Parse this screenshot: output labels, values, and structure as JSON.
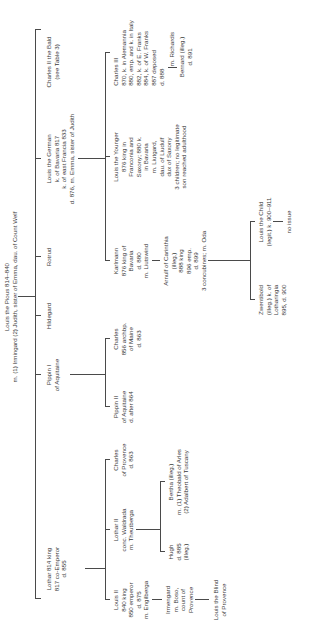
{
  "root": {
    "lines": [
      "Louis the Pious 814–840",
      "m. (1) Irmingard (2) Judith, sister of Emma, dau. of Count Welf"
    ]
  },
  "generation1": [
    {
      "id": "lothar",
      "lines": [
        "Lothar 814 king",
        "817 co-Emperor",
        "d. 855"
      ]
    },
    {
      "id": "pippin1",
      "lines": [
        "Pippin I",
        "of Aquitaine"
      ]
    },
    {
      "id": "hildegard",
      "lines": [
        "Hildegard"
      ]
    },
    {
      "id": "rotrud",
      "lines": [
        "Rotrud"
      ]
    },
    {
      "id": "louis-german",
      "lines": [
        "Louis the German",
        "k. of Bavaria 817",
        "k. of east Francia 833",
        "d. 876, m. Emma, sister of Judith"
      ]
    },
    {
      "id": "charles-bald",
      "lines": [
        "Charles II the Bald",
        "(see Table 3)"
      ]
    }
  ],
  "generation2": [
    {
      "id": "louis2",
      "lines": [
        "Louis II",
        "840 king",
        "850 emperor",
        "d. 875",
        "m. Engilberga"
      ]
    },
    {
      "id": "lothar2",
      "lines": [
        "Lothar II",
        "conc. Waldrada",
        "m. Theutberga"
      ]
    },
    {
      "id": "charles-provence",
      "lines": [
        "Charles",
        "of Provence",
        "d. 863"
      ]
    },
    {
      "id": "pippin2",
      "lines": [
        "Pippin II",
        "of Aquitaine",
        "d. after 864"
      ]
    },
    {
      "id": "charles-maine",
      "lines": [
        "Charles",
        "856 archbp.",
        "of Maine",
        "d. 863"
      ]
    },
    {
      "id": "karlmann",
      "lines": [
        "Karlmann",
        "876 king of",
        "Bavaria",
        "d. 880",
        "m. Liutswind"
      ]
    },
    {
      "id": "louis-younger",
      "lines": [
        "Louis the Younger",
        "876 king in",
        "Franconia and",
        "Saxony; 880 k.",
        "in Bavaria",
        "m. Liutgard,",
        "dau. of Liudulf",
        "dux of Saxony",
        "3 children; no legitimate",
        "son reached adulthood"
      ]
    },
    {
      "id": "charles3",
      "lines": [
        "Charles III",
        "870, k. in Alemannia",
        "880, emp. and k. in Italy",
        "882, k. of E. Franks",
        "884, k. of W. Franks",
        "887 deposed",
        "d. 888"
      ]
    }
  ],
  "generation3": [
    {
      "id": "irmengard",
      "lines": [
        "Irmengard",
        "m. Boso,",
        "count of",
        "Provence"
      ]
    },
    {
      "id": "hugh",
      "lines": [
        "Hugh",
        "d. 885",
        "(illeg.)"
      ]
    },
    {
      "id": "bertha",
      "lines": [
        "Bertha (illeg.)",
        "m. (1) Theobald of Arles",
        "(2) Adalbert of Tuscany"
      ]
    },
    {
      "id": "arnulf",
      "lines": [
        "Arnulf of Carinthia",
        "(illeg.)",
        "888 king",
        "896 emp.",
        "d. 899",
        "3 concubines; m. Oda"
      ]
    },
    {
      "id": "richardis",
      "lines": [
        "m. Richardis"
      ]
    },
    {
      "id": "bernard",
      "lines": [
        "Bernard (illeg.)",
        "d. 891"
      ]
    }
  ],
  "generation4": [
    {
      "id": "louis-blind",
      "lines": [
        "Louis the Blind",
        "of Provence"
      ]
    },
    {
      "id": "zwentibold",
      "lines": [
        "Zwentibold",
        "(illeg.) k. of",
        "Lotharingia",
        "895, d. 900"
      ]
    },
    {
      "id": "louis-child",
      "lines": [
        "Louis the Child",
        "(legit.) k. 900–911"
      ]
    },
    {
      "id": "no-issue",
      "lines": [
        "no issue"
      ]
    }
  ]
}
